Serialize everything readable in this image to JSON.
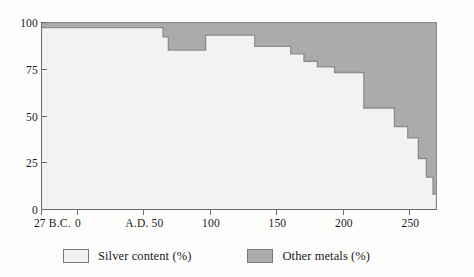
{
  "chart_data": {
    "type": "area",
    "title": "",
    "subtitle": "",
    "xlabel": "",
    "ylabel": "",
    "xlim": [
      -27,
      270
    ],
    "ylim": [
      0,
      100
    ],
    "grid": false,
    "stacked": true,
    "step": true,
    "legend_position": "bottom",
    "axis": {
      "y_ticks": [
        0,
        25,
        50,
        75,
        100
      ],
      "y_tick_labels": [
        "0",
        "25",
        "50",
        "75",
        "100"
      ],
      "x_ticks": [
        -27,
        0,
        50,
        100,
        150,
        200,
        250
      ],
      "x_tick_labels": [
        "27 B.C.",
        "0",
        "A.D. 50",
        "100",
        "150",
        "200",
        "250"
      ]
    },
    "legend": [
      {
        "label": "Silver content (%)",
        "color": "#f2f2f2"
      },
      {
        "label": "Other metals (%)",
        "color": "#ababab"
      }
    ],
    "series": [
      {
        "name": "Silver content (%)",
        "color": "#f2f2f2",
        "values": [
          {
            "x": -27,
            "y": 97
          },
          {
            "x": 64,
            "y": 92
          },
          {
            "x": 68,
            "y": 85
          },
          {
            "x": 96,
            "y": 93
          },
          {
            "x": 133,
            "y": 87
          },
          {
            "x": 160,
            "y": 83
          },
          {
            "x": 170,
            "y": 79
          },
          {
            "x": 180,
            "y": 76
          },
          {
            "x": 193,
            "y": 73
          },
          {
            "x": 215,
            "y": 54
          },
          {
            "x": 238,
            "y": 44
          },
          {
            "x": 248,
            "y": 38
          },
          {
            "x": 256,
            "y": 27
          },
          {
            "x": 262,
            "y": 17
          },
          {
            "x": 267,
            "y": 8
          },
          {
            "x": 270,
            "y": 5
          }
        ]
      },
      {
        "name": "Other metals (%)",
        "color": "#ababab",
        "values": [
          {
            "x": -27,
            "y": 3
          },
          {
            "x": 64,
            "y": 8
          },
          {
            "x": 68,
            "y": 15
          },
          {
            "x": 96,
            "y": 7
          },
          {
            "x": 133,
            "y": 13
          },
          {
            "x": 160,
            "y": 17
          },
          {
            "x": 170,
            "y": 21
          },
          {
            "x": 180,
            "y": 24
          },
          {
            "x": 193,
            "y": 27
          },
          {
            "x": 215,
            "y": 46
          },
          {
            "x": 238,
            "y": 56
          },
          {
            "x": 248,
            "y": 62
          },
          {
            "x": 256,
            "y": 73
          },
          {
            "x": 262,
            "y": 83
          },
          {
            "x": 267,
            "y": 92
          },
          {
            "x": 270,
            "y": 95
          }
        ]
      }
    ]
  },
  "colors": {
    "silver_fill": "#f2f2f2",
    "other_fill": "#ababab",
    "outline": "#8c8c8c",
    "axis": "#6a6a6a",
    "text": "#1a1a1a",
    "background": "#fdfdfc"
  }
}
